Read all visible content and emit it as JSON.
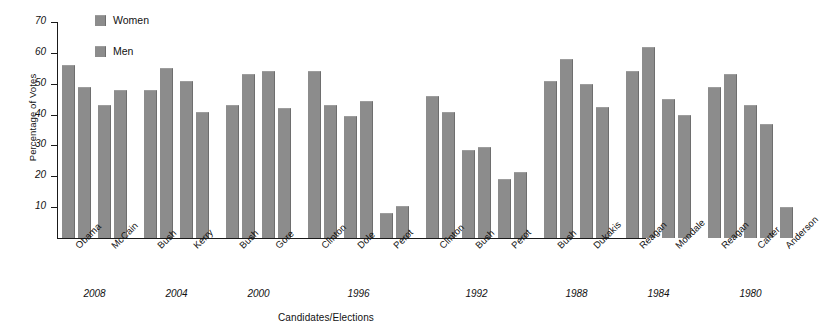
{
  "chart_data": {
    "type": "bar",
    "title": "",
    "xlabel": "Candidates/Elections",
    "ylabel": "Percentage of Votes",
    "ylim": [
      0,
      70
    ],
    "yticks": [
      10,
      20,
      30,
      40,
      50,
      60,
      70
    ],
    "grid": false,
    "legend_position": "top-left",
    "legend": [
      "Women",
      "Men"
    ],
    "categories": [
      "Obama",
      "McCain",
      "Bush",
      "Kerry",
      "Bush",
      "Gore",
      "Clinton",
      "Dole",
      "Perot",
      "Clinton",
      "Bush",
      "Perot",
      "Bush",
      "Dukakis",
      "Reagan",
      "Mondale",
      "Reagan",
      "Carter",
      "Anderson"
    ],
    "series": [
      {
        "name": "Women",
        "values": [
          56,
          43,
          48,
          51,
          43,
          54,
          54,
          39.5,
          8,
          46,
          28.5,
          19,
          51,
          50,
          54,
          45,
          49,
          43,
          10
        ]
      },
      {
        "name": "Men",
        "values": [
          49,
          48,
          55,
          41,
          53,
          42,
          43,
          44.5,
          10.5,
          41,
          29.5,
          21.5,
          58,
          42.5,
          62,
          40,
          53,
          37,
          null
        ]
      }
    ],
    "groups": [
      {
        "year": "2008",
        "candidates": [
          "Obama",
          "McCain"
        ]
      },
      {
        "year": "2004",
        "candidates": [
          "Bush",
          "Kerry"
        ]
      },
      {
        "year": "2000",
        "candidates": [
          "Bush",
          "Gore"
        ]
      },
      {
        "year": "1996",
        "candidates": [
          "Clinton",
          "Dole",
          "Perot"
        ]
      },
      {
        "year": "1992",
        "candidates": [
          "Clinton",
          "Bush",
          "Perot"
        ]
      },
      {
        "year": "1988",
        "candidates": [
          "Bush",
          "Dukakis"
        ]
      },
      {
        "year": "1984",
        "candidates": [
          "Reagan",
          "Mondale"
        ]
      },
      {
        "year": "1980",
        "candidates": [
          "Reagan",
          "Carter",
          "Anderson"
        ]
      }
    ],
    "colors": {
      "bar": "#8c8c8c",
      "bar_edge": "#6e6e6e",
      "axis": "#1a1a1a",
      "background": "#ffffff"
    }
  }
}
